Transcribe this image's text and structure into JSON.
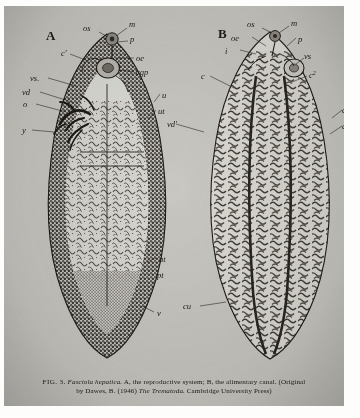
{
  "plate": {
    "name": "figure-plate",
    "background_hex": "#c9c8c2",
    "ink_hex": "#16130f",
    "panels": [
      {
        "id": "A",
        "panel_letter": "A",
        "subject": "Fasciola hepatica",
        "description": "the reproductive system",
        "labels": [
          {
            "key": "os",
            "text": "os",
            "side": "top"
          },
          {
            "key": "m",
            "text": "m",
            "side": "top-right"
          },
          {
            "key": "p",
            "text": "p",
            "side": "right"
          },
          {
            "key": "oe",
            "text": "oe",
            "side": "right"
          },
          {
            "key": "cgp",
            "text": "cgp",
            "side": "right"
          },
          {
            "key": "c1",
            "text": "c'",
            "side": "left"
          },
          {
            "key": "vs",
            "text": "vs.",
            "side": "left"
          },
          {
            "key": "vd",
            "text": "vd",
            "side": "left"
          },
          {
            "key": "o",
            "text": "o",
            "side": "left"
          },
          {
            "key": "y",
            "text": "y",
            "side": "left"
          },
          {
            "key": "u",
            "text": "u",
            "side": "right"
          },
          {
            "key": "ut",
            "text": "ut",
            "side": "right"
          },
          {
            "key": "at",
            "text": "at",
            "side": "right"
          },
          {
            "key": "pt",
            "text": "pt",
            "side": "right"
          },
          {
            "key": "v",
            "text": "v",
            "side": "right"
          }
        ]
      },
      {
        "id": "B",
        "panel_letter": "B",
        "subject": "Fasciola hepatica",
        "description": "the alimentary canal",
        "labels": [
          {
            "key": "os",
            "text": "os",
            "side": "top"
          },
          {
            "key": "m",
            "text": "m",
            "side": "top-right"
          },
          {
            "key": "oe",
            "text": "oe",
            "side": "top-left"
          },
          {
            "key": "p",
            "text": "p",
            "side": "right"
          },
          {
            "key": "i",
            "text": "i",
            "side": "left"
          },
          {
            "key": "vs",
            "text": "vs",
            "side": "right"
          },
          {
            "key": "c2",
            "text": "c",
            "sup": "2",
            "side": "right"
          },
          {
            "key": "c",
            "text": "c",
            "side": "left"
          },
          {
            "key": "cr",
            "text": "c",
            "side": "right-edge"
          },
          {
            "key": "cr2",
            "text": "c",
            "sup": "1",
            "side": "right-edge"
          },
          {
            "key": "vdp",
            "text": "vd'",
            "side": "left"
          },
          {
            "key": "cu",
            "text": "cu",
            "side": "bottom-left"
          }
        ]
      }
    ]
  },
  "caption": {
    "fig_number": "FIG. 3.",
    "species": "Fasciola hepatica.",
    "part_a": "A, the reproductive system;",
    "part_b": "B, the alimentary canal.",
    "credit_open": "(Original",
    "credit_line2_prefix": "by Dawes, B. (1946)",
    "credit_work": "The Trematoda.",
    "credit_publisher": "Cambridge University Press)"
  }
}
